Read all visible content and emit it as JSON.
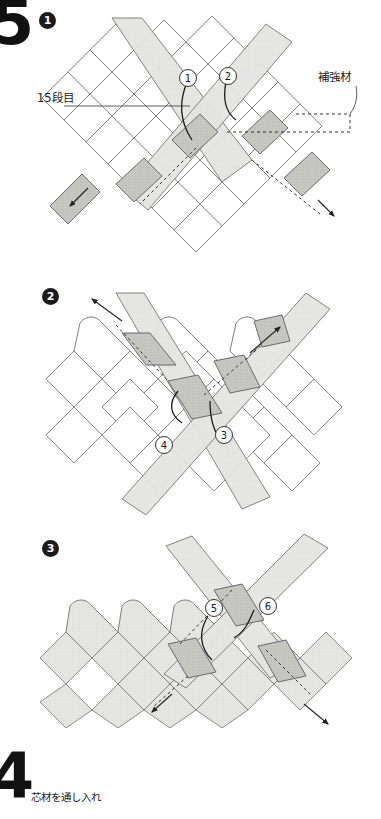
{
  "page": {
    "background_color": "#ffffff",
    "width": 381,
    "height": 819
  },
  "chapter_markers": [
    {
      "id": "chapter-top",
      "label": "5"
    },
    {
      "id": "chapter-bottom",
      "label": "4"
    }
  ],
  "steps": [
    {
      "bullet": "1",
      "annotations": [
        {
          "name": "row-label",
          "text": "15段目"
        },
        {
          "name": "reinforcement-label",
          "text": "補強材"
        }
      ],
      "weave_markers": [
        "1",
        "2"
      ]
    },
    {
      "bullet": "2",
      "annotations": [],
      "weave_markers": [
        "4",
        "3"
      ]
    },
    {
      "bullet": "3",
      "annotations": [],
      "weave_markers": [
        "5",
        "6"
      ]
    }
  ],
  "caption": {
    "text": "芯材を通し入れ"
  },
  "colors": {
    "strip_light": "#e4e4e2",
    "strip_mid": "#cfcfcc",
    "strip_dark": "#b5b5b2",
    "outline": "#6e6e6e",
    "ink": "#1a1a1a"
  }
}
